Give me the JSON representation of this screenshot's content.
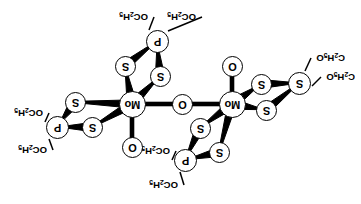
{
  "figure": {
    "orientation_note": "Image scanned upside down; all labels rotated 180 degrees",
    "background_color": "#ffffff",
    "line_color": "#000000"
  },
  "labels": {
    "mo": "Mo",
    "s": "S",
    "o": "O",
    "p": "P",
    "ethoxy_left": "OC",
    "ethoxy_right": "C"
  },
  "atoms": [
    {
      "id": "mo-left",
      "label": "Mo",
      "x": 132,
      "y": 104,
      "kind": "metal"
    },
    {
      "id": "mo-right",
      "label": "Mo",
      "x": 232,
      "y": 104,
      "kind": "metal"
    },
    {
      "id": "o-bridge",
      "label": "O",
      "x": 182,
      "y": 104,
      "kind": "oxygen"
    },
    {
      "id": "o-term-left",
      "label": "O",
      "x": 132,
      "y": 147,
      "kind": "oxygen"
    },
    {
      "id": "o-term-right",
      "label": "O",
      "x": 232,
      "y": 66,
      "kind": "oxygen"
    },
    {
      "id": "s-top-a",
      "label": "S",
      "x": 125,
      "y": 66,
      "kind": "sulfur"
    },
    {
      "id": "s-top-b",
      "label": "S",
      "x": 160,
      "y": 76,
      "kind": "sulfur"
    },
    {
      "id": "p-top",
      "label": "P",
      "x": 157,
      "y": 41,
      "kind": "phosphorus"
    },
    {
      "id": "s-left-a",
      "label": "S",
      "x": 75,
      "y": 102,
      "kind": "sulfur"
    },
    {
      "id": "s-left-b",
      "label": "S",
      "x": 92,
      "y": 127,
      "kind": "sulfur"
    },
    {
      "id": "p-left",
      "label": "P",
      "x": 57,
      "y": 127,
      "kind": "phosphorus"
    },
    {
      "id": "s-bot-a",
      "label": "S",
      "x": 200,
      "y": 128,
      "kind": "sulfur"
    },
    {
      "id": "s-bot-b",
      "label": "S",
      "x": 219,
      "y": 152,
      "kind": "sulfur"
    },
    {
      "id": "p-bot",
      "label": "P",
      "x": 185,
      "y": 160,
      "kind": "phosphorus"
    },
    {
      "id": "s-right-a",
      "label": "S",
      "x": 261,
      "y": 84,
      "kind": "sulfur"
    },
    {
      "id": "s-right-b",
      "label": "S",
      "x": 266,
      "y": 110,
      "kind": "sulfur"
    },
    {
      "id": "p-right",
      "label": "S",
      "x": 299,
      "y": 83,
      "kind": "phosphorus"
    }
  ],
  "bonds": [
    {
      "from": "mo-left",
      "to": "o-bridge",
      "style": "plain"
    },
    {
      "from": "o-bridge",
      "to": "mo-right",
      "style": "plain"
    },
    {
      "from": "mo-left",
      "to": "o-term-left",
      "style": "plain"
    },
    {
      "from": "mo-right",
      "to": "o-term-right",
      "style": "plain"
    },
    {
      "from": "mo-left",
      "to": "s-top-a",
      "style": "wedge"
    },
    {
      "from": "mo-left",
      "to": "s-top-b",
      "style": "wedge"
    },
    {
      "from": "s-top-a",
      "to": "p-top",
      "style": "wedge"
    },
    {
      "from": "s-top-b",
      "to": "p-top",
      "style": "wedge"
    },
    {
      "from": "mo-left",
      "to": "s-left-a",
      "style": "wedge"
    },
    {
      "from": "mo-left",
      "to": "s-left-b",
      "style": "wedge"
    },
    {
      "from": "s-left-a",
      "to": "p-left",
      "style": "wedge"
    },
    {
      "from": "s-left-b",
      "to": "p-left",
      "style": "wedge"
    },
    {
      "from": "mo-right",
      "to": "s-bot-a",
      "style": "wedge"
    },
    {
      "from": "mo-right",
      "to": "s-bot-b",
      "style": "wedge"
    },
    {
      "from": "s-bot-a",
      "to": "p-bot",
      "style": "wedge"
    },
    {
      "from": "s-bot-b",
      "to": "p-bot",
      "style": "wedge"
    },
    {
      "from": "mo-right",
      "to": "s-right-a",
      "style": "wedge"
    },
    {
      "from": "mo-right",
      "to": "s-right-b",
      "style": "wedge"
    },
    {
      "from": "s-right-a",
      "to": "p-right",
      "style": "wedge"
    },
    {
      "from": "s-right-b",
      "to": "p-right",
      "style": "wedge"
    }
  ],
  "substituents": [
    {
      "id": "et-top-1",
      "text_main": "OC",
      "sub1": "2",
      "text_mid": "H",
      "sub2": "5",
      "anchor_x": 149,
      "anchor_y": 30,
      "label_x": 148,
      "label_y": 22,
      "order": "O-first"
    },
    {
      "id": "et-top-2",
      "text_main": "OC",
      "sub1": "2",
      "text_mid": "H",
      "sub2": "5",
      "anchor_x": 168,
      "anchor_y": 31,
      "label_x": 196,
      "label_y": 22,
      "order": "O-first"
    },
    {
      "id": "et-left-1",
      "text_main": "OC",
      "sub1": "2",
      "text_mid": "H",
      "sub2": "5",
      "anchor_x": 45,
      "anchor_y": 122,
      "label_x": 43,
      "label_y": 118,
      "order": "O-first"
    },
    {
      "id": "et-left-2",
      "text_main": "OC",
      "sub1": "2",
      "text_mid": "H",
      "sub2": "5",
      "anchor_x": 49,
      "anchor_y": 139,
      "label_x": 47,
      "label_y": 155,
      "order": "O-first"
    },
    {
      "id": "et-bot-1",
      "text_main": "OC",
      "sub1": "2",
      "text_mid": "H",
      "sub2": "5",
      "anchor_x": 172,
      "anchor_y": 160,
      "label_x": 170,
      "label_y": 156,
      "order": "O-first"
    },
    {
      "id": "et-bot-2",
      "text_main": "OC",
      "sub1": "2",
      "text_mid": "H",
      "sub2": "5",
      "anchor_x": 180,
      "anchor_y": 172,
      "label_x": 178,
      "label_y": 190,
      "order": "O-first"
    },
    {
      "id": "et-right-1",
      "text_main": "C",
      "sub1": "2",
      "text_mid": "H",
      "sub2": "5",
      "text_end": "O",
      "anchor_x": 305,
      "anchor_y": 71,
      "label_x": 345,
      "label_y": 63,
      "order": "C-first"
    },
    {
      "id": "et-right-2",
      "text_main": "C",
      "sub1": "2",
      "text_mid": "H",
      "sub2": "5",
      "text_end": "O",
      "anchor_x": 312,
      "anchor_y": 86,
      "label_x": 355,
      "label_y": 82,
      "order": "C-first"
    }
  ]
}
